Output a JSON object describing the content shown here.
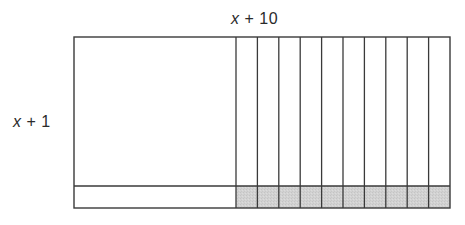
{
  "diagram": {
    "type": "area-model",
    "labels": {
      "top": {
        "variable": "x",
        "rest": " + 10"
      },
      "left": {
        "variable": "x",
        "rest": " + 1"
      }
    },
    "geometry": {
      "left": 74,
      "top": 37,
      "right": 450,
      "bottom": 208,
      "square_right": 236,
      "divider_y": 186,
      "strip_count": 10
    },
    "colors": {
      "stroke": "#3a3a3a",
      "shaded_fill": "#d2d2d2",
      "background": "#ffffff",
      "text": "#2b2b2b"
    },
    "regions": [
      {
        "name": "x-squared-square",
        "description": "x by x square",
        "shaded": false
      },
      {
        "name": "x-strips",
        "description": "10 vertical strips, each 1 by x",
        "count": 10,
        "shaded": false
      },
      {
        "name": "x-bottom-strip",
        "description": "1 by x horizontal strip",
        "shaded": false
      },
      {
        "name": "unit-squares",
        "description": "10 unit squares, 1 by 1",
        "count": 10,
        "shaded": true
      }
    ]
  }
}
